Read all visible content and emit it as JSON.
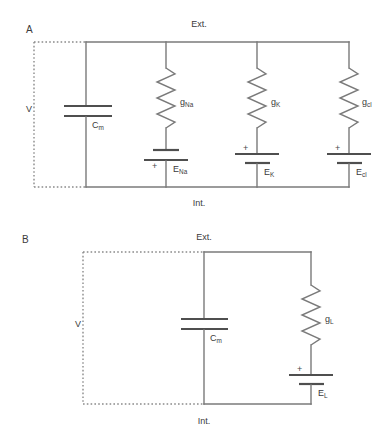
{
  "figure": {
    "background": "#ffffff",
    "wire_color": "#7a7a7a",
    "text_color": "#3b3b3b",
    "plate_color": "#4f4f4f"
  },
  "panelA": {
    "letter": "A",
    "top_label": "Ext.",
    "bottom_label": "Int.",
    "voltage_label": "V",
    "capacitor": {
      "base": "C",
      "sub": "m"
    },
    "branches": [
      {
        "conductance": {
          "base": "g",
          "sub": "Na"
        },
        "emf": {
          "base": "E",
          "sub": "Na"
        },
        "polarity": "+",
        "polarity_position": "below"
      },
      {
        "conductance": {
          "base": "g",
          "sub": "K"
        },
        "emf": {
          "base": "E",
          "sub": "K"
        },
        "polarity": "+",
        "polarity_position": "above"
      },
      {
        "conductance": {
          "base": "g",
          "sub": "cl"
        },
        "emf": {
          "base": "E",
          "sub": "cl"
        },
        "polarity": "+",
        "polarity_position": "above"
      }
    ]
  },
  "panelB": {
    "letter": "B",
    "top_label": "Ext.",
    "bottom_label": "Int.",
    "voltage_label": "V",
    "capacitor": {
      "base": "C",
      "sub": "m"
    },
    "branches": [
      {
        "conductance": {
          "base": "g",
          "sub": "L"
        },
        "emf": {
          "base": "E",
          "sub": "L"
        },
        "polarity": "+",
        "polarity_position": "above"
      }
    ]
  }
}
